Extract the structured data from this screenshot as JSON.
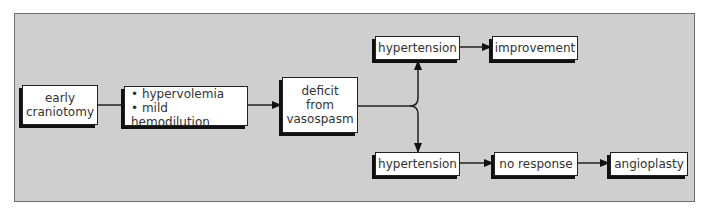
{
  "diagram": {
    "nodes": {
      "early_craniotomy": {
        "line1": "early",
        "line2": "craniotomy"
      },
      "treatment": {
        "item1": "• hypervolemia",
        "item2": "• mild hemodilution"
      },
      "deficit": {
        "line1": "deficit",
        "line2": "from",
        "line3": "vasospasm"
      },
      "hypertension_top": {
        "label": "hypertension"
      },
      "improvement": {
        "label": "improvement"
      },
      "hypertension_bottom": {
        "label": "hypertension"
      },
      "no_response": {
        "label": "no response"
      },
      "angioplasty": {
        "label": "angioplasty"
      }
    },
    "colors": {
      "background": "#cfcfcf",
      "box": "#ffffff",
      "line": "#111111"
    }
  }
}
